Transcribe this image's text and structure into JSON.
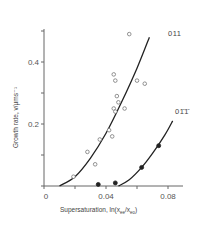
{
  "chart_data": {
    "type": "scatter",
    "title": "",
    "xlabel": "Supersaturation, ln(x_ee/x_eo)",
    "ylabel": "Growth rate, v/µms⁻¹",
    "xlim": [
      0,
      0.09
    ],
    "ylim": [
      0,
      0.5
    ],
    "x_ticks": [
      0,
      0.02,
      0.04,
      0.06,
      0.08
    ],
    "x_tick_labels": [
      "0",
      "",
      "0.04",
      "",
      "0.08"
    ],
    "y_ticks": [
      0,
      0.1,
      0.2,
      0.3,
      0.4,
      0.5
    ],
    "y_tick_labels": [
      "",
      "",
      "0.2",
      "",
      "0.4",
      ""
    ],
    "grid": false,
    "legend": "none (curves labelled directly)",
    "series": [
      {
        "name": "011",
        "marker": "open-circle",
        "points": [
          [
            0.019,
            0.03
          ],
          [
            0.028,
            0.11
          ],
          [
            0.033,
            0.07
          ],
          [
            0.036,
            0.15
          ],
          [
            0.042,
            0.18
          ],
          [
            0.044,
            0.16
          ],
          [
            0.045,
            0.25
          ],
          [
            0.046,
            0.24
          ],
          [
            0.045,
            0.36
          ],
          [
            0.046,
            0.34
          ],
          [
            0.047,
            0.29
          ],
          [
            0.048,
            0.27
          ],
          [
            0.052,
            0.25
          ],
          [
            0.055,
            0.49
          ],
          [
            0.06,
            0.34
          ],
          [
            0.065,
            0.33
          ]
        ],
        "fit_curve": [
          [
            0.01,
            0.0
          ],
          [
            0.02,
            0.03
          ],
          [
            0.03,
            0.09
          ],
          [
            0.04,
            0.17
          ],
          [
            0.05,
            0.27
          ],
          [
            0.06,
            0.38
          ],
          [
            0.068,
            0.48
          ]
        ],
        "label": "011"
      },
      {
        "name": "01̄1̄",
        "marker": "filled-circle",
        "points": [
          [
            0.035,
            0.005
          ],
          [
            0.046,
            0.01
          ],
          [
            0.063,
            0.06
          ],
          [
            0.074,
            0.13
          ]
        ],
        "fit_curve": [
          [
            0.048,
            0.0
          ],
          [
            0.055,
            0.02
          ],
          [
            0.063,
            0.06
          ],
          [
            0.07,
            0.105
          ],
          [
            0.078,
            0.165
          ],
          [
            0.083,
            0.21
          ]
        ],
        "label": "01̄1̄"
      }
    ]
  },
  "labels": {
    "x_axis_title_prefix": "Supersaturation, ln(x",
    "x_axis_sub1": "ee",
    "x_axis_mid": "/x",
    "x_axis_sub2": "eo",
    "x_axis_suffix": ")",
    "y_axis_title": "Growth rate, v/µms⁻¹",
    "curve_label_a": "011",
    "curve_label_b": "01̄1̄"
  }
}
